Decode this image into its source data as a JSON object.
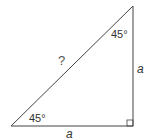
{
  "diagram": {
    "type": "right-isosceles-triangle",
    "stroke_color": "#444444",
    "labels": {
      "top_angle": "45°",
      "bottom_left_angle": "45°",
      "hypotenuse": "?",
      "right_side": "a",
      "bottom_side": "a"
    },
    "right_angle_marker": true
  }
}
